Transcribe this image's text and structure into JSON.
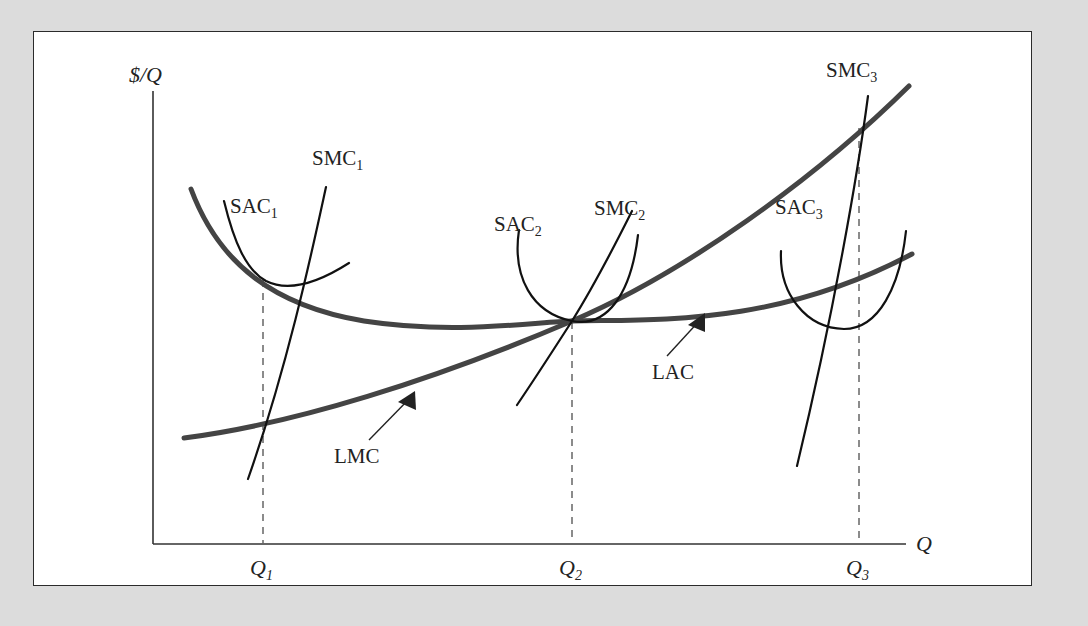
{
  "figure": {
    "background_color": "#dcdcdc",
    "panel_color": "#ffffff",
    "panel_border_color": "#2b2b2b"
  },
  "chart_data": {
    "type": "line",
    "title": "",
    "subtitle": "",
    "xlabel": "Q",
    "ylabel": "$/Q",
    "grid": false,
    "legend_position": "inline-annotations",
    "xlim": [
      0,
      1
    ],
    "ylim": [
      0,
      1
    ],
    "axis_labels": {
      "y_axis": "$/Q",
      "x_axis": "Q"
    },
    "tick_labels": {
      "x": [
        "Q1",
        "Q2",
        "Q3"
      ]
    },
    "annotations": [
      {
        "text": "SAC",
        "subscript": "1",
        "x": 233,
        "y": 181
      },
      {
        "text": "SMC",
        "subscript": "1",
        "x": 337,
        "y": 163
      },
      {
        "text": "SAC",
        "subscript": "2",
        "x": 530,
        "y": 229
      },
      {
        "text": "SMC",
        "subscript": "2",
        "x": 635,
        "y": 213
      },
      {
        "text": "SAC",
        "subscript": "3",
        "x": 800,
        "y": 212
      },
      {
        "text": "SMC",
        "subscript": "3",
        "x": 859,
        "y": 75
      },
      {
        "text": "LMC",
        "subscript": "",
        "x": 364,
        "y": 461
      },
      {
        "text": "LAC",
        "subscript": "",
        "x": 686,
        "y": 360
      }
    ],
    "series": [
      {
        "name": "LAC",
        "role": "long-run average cost",
        "style": "thick-gray-ushape",
        "color": "#444444",
        "note": "U-shaped long-run average cost curve, minimum at Q2"
      },
      {
        "name": "LMC",
        "role": "long-run marginal cost",
        "style": "thick-gray-rising",
        "color": "#444444",
        "note": "Upward sloping long-run marginal cost, cuts LAC at its minimum Q2"
      },
      {
        "name": "SAC1",
        "role": "short-run average cost plant 1",
        "style": "thin-black-ushape",
        "color": "#111111",
        "note": "Tangent to LAC at Q1, on falling portion of LAC"
      },
      {
        "name": "SMC1",
        "role": "short-run marginal cost plant 1",
        "style": "thin-black-steep",
        "color": "#111111",
        "note": "Crosses LMC at Q1"
      },
      {
        "name": "SAC2",
        "role": "short-run average cost plant 2",
        "style": "thin-black-ushape",
        "color": "#111111",
        "note": "Tangent to LAC at its minimum Q2"
      },
      {
        "name": "SMC2",
        "role": "short-run marginal cost plant 2",
        "style": "thin-black-steep",
        "color": "#111111",
        "note": "Passes through Q2 tangency point with LMC and LAC"
      },
      {
        "name": "SAC3",
        "role": "short-run average cost plant 3",
        "style": "thin-black-ushape",
        "color": "#111111",
        "note": "Tangent to LAC at Q3, on rising portion of LAC"
      },
      {
        "name": "SMC3",
        "role": "short-run marginal cost plant 3",
        "style": "thin-black-steep",
        "color": "#111111",
        "note": "Crosses LMC at Q3"
      }
    ],
    "key_points": [
      {
        "label": "Q1",
        "x_px": 262,
        "description": "Tangency of SAC1 with falling LAC; SMC1 crosses LMC"
      },
      {
        "label": "Q2",
        "x_px": 571,
        "description": "Minimum of LAC; LMC = LAC = SAC2 = SMC2"
      },
      {
        "label": "Q3",
        "x_px": 858,
        "description": "Tangency of SAC3 with rising LAC; SMC3 crosses LMC"
      }
    ]
  }
}
